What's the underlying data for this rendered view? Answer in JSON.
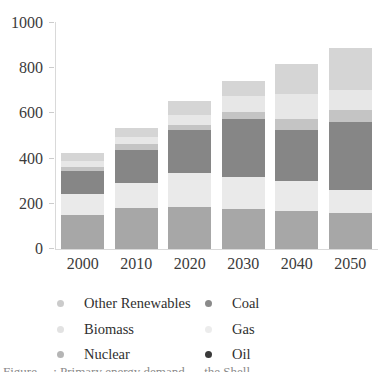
{
  "chart_data": {
    "type": "bar",
    "stacked": true,
    "title": "",
    "xlabel": "",
    "ylabel": "",
    "categories": [
      "2000",
      "2010",
      "2020",
      "2030",
      "2040",
      "2050"
    ],
    "series": [
      {
        "name": "Oil",
        "values": [
          150,
          180,
          185,
          175,
          170,
          160
        ],
        "bar_color": "#a7a7a7"
      },
      {
        "name": "Gas",
        "values": [
          95,
          110,
          150,
          145,
          130,
          100
        ],
        "bar_color": "#eaeaea"
      },
      {
        "name": "Coal",
        "values": [
          100,
          150,
          190,
          255,
          225,
          300
        ],
        "bar_color": "#868686"
      },
      {
        "name": "Nuclear",
        "values": [
          20,
          25,
          25,
          30,
          50,
          55
        ],
        "bar_color": "#c4c4c4"
      },
      {
        "name": "Biomass",
        "values": [
          25,
          30,
          45,
          70,
          110,
          90
        ],
        "bar_color": "#e7e7e7"
      },
      {
        "name": "Other Renewables",
        "values": [
          35,
          40,
          60,
          70,
          135,
          185
        ],
        "bar_color": "#d5d5d5"
      }
    ],
    "totals": [
      425,
      535,
      655,
      745,
      820,
      890
    ],
    "ylim": [
      0,
      1000
    ],
    "yticks": [
      0,
      200,
      400,
      600,
      800,
      1000
    ],
    "grid": false,
    "legend_position": "bottom"
  },
  "legend": {
    "items": [
      {
        "label": "Other Renewables",
        "color": "#cbcbcb"
      },
      {
        "label": "Biomass",
        "color": "#e2e2e2"
      },
      {
        "label": "Nuclear",
        "color": "#b5b5b5"
      },
      {
        "label": "Coal",
        "color": "#8a8a8a"
      },
      {
        "label": "Gas",
        "color": "#ececec"
      },
      {
        "label": "Oil",
        "color": "#3a3a3a"
      }
    ]
  },
  "caption": {
    "text": "Figure …: Primary energy demand … the Shell …"
  }
}
